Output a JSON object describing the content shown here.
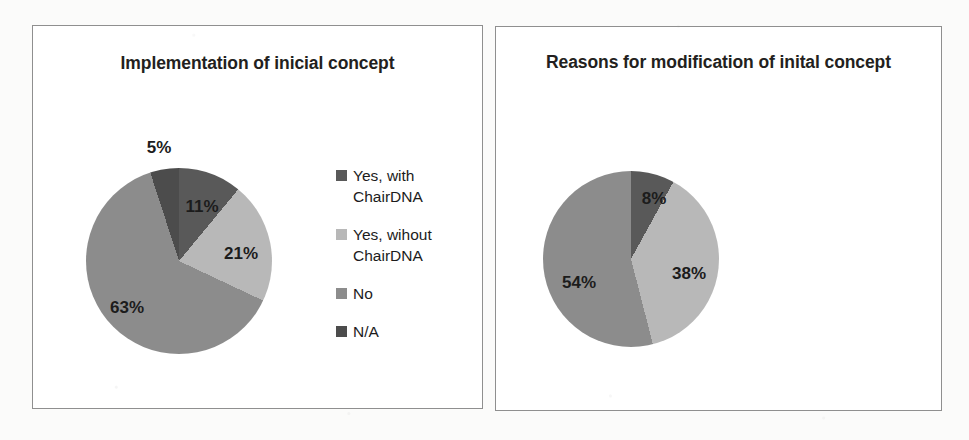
{
  "page": {
    "background_color": "#fbfbfa",
    "panel_border_color": "#8f8f8f"
  },
  "palette": {
    "darkest": "#4c4c4c",
    "dark": "#595959",
    "medium": "#8c8c8c",
    "light": "#b8b8b8"
  },
  "charts": [
    {
      "id": "implementation-of-inicial-concept",
      "title": "Implementation of inicial concept",
      "legend_position": "right",
      "chart_data": {
        "type": "pie",
        "title": "Implementation of inicial concept",
        "categories": [
          "Yes, with ChairDNA",
          "Yes, wihout ChairDNA",
          "No",
          "N/A"
        ],
        "values": [
          11,
          21,
          63,
          5
        ],
        "value_labels": [
          "11%",
          "21%",
          "63%",
          "5%"
        ],
        "colors": [
          "#595959",
          "#b8b8b8",
          "#8c8c8c",
          "#4c4c4c"
        ],
        "units": "percent",
        "start_angle_deg": 0,
        "direction": "clockwise",
        "legend": [
          "Yes, with ChairDNA",
          "Yes, wihout ChairDNA",
          "No",
          "N/A"
        ],
        "legend_position": "right",
        "grid": false,
        "xlabel": "",
        "ylabel": ""
      },
      "legend_items": [
        {
          "label": "Yes, with ChairDNA",
          "color": "#595959"
        },
        {
          "label": "Yes, wihout ChairDNA",
          "color": "#b8b8b8"
        },
        {
          "label": "No",
          "color": "#8c8c8c"
        },
        {
          "label": "N/A",
          "color": "#4c4c4c"
        }
      ],
      "slice_labels": [
        {
          "text": "11%",
          "x": 201,
          "y": 206
        },
        {
          "text": "21%",
          "x": 240,
          "y": 253
        },
        {
          "text": "63%",
          "x": 126,
          "y": 307
        },
        {
          "text": "5%",
          "x": 158,
          "y": 147
        }
      ]
    },
    {
      "id": "reasons-for-modification-of-inital-concept",
      "title": "Reasons for modification of inital concept",
      "legend_position": "right",
      "chart_data": {
        "type": "pie",
        "title": "Reasons for modification of inital concept",
        "categories": [
          "Limitations of ChairDNA",
          "Exploration of ChairDNA",
          "Both"
        ],
        "values": [
          8,
          38,
          54
        ],
        "value_labels": [
          "8%",
          "38%",
          "54%"
        ],
        "colors": [
          "#595959",
          "#b8b8b8",
          "#8c8c8c"
        ],
        "units": "percent",
        "start_angle_deg": 0,
        "direction": "clockwise",
        "legend": [
          "Limitations of ChairDNA",
          "Exploration of ChairDNA",
          "Both"
        ],
        "legend_position": "right",
        "grid": false,
        "xlabel": "",
        "ylabel": ""
      },
      "legend_items": [
        {
          "label": "Limitations of ChairDNA",
          "color": "#595959"
        },
        {
          "label": "Exploration of ChairDNA",
          "color": "#b8b8b8"
        },
        {
          "label": "Both",
          "color": "#8c8c8c"
        }
      ],
      "slice_labels": [
        {
          "text": "8%",
          "x": 653,
          "y": 198
        },
        {
          "text": "38%",
          "x": 688,
          "y": 273
        },
        {
          "text": "54%",
          "x": 578,
          "y": 282
        }
      ]
    }
  ]
}
